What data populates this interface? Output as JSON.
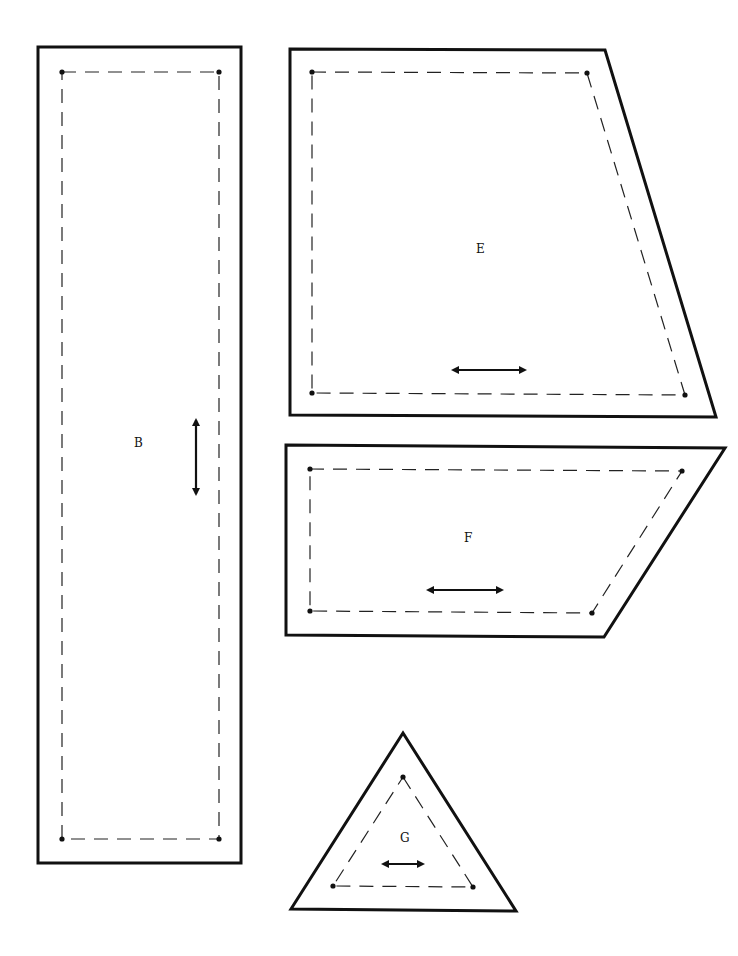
{
  "pattern": {
    "colors": {
      "line": "#111111",
      "background": "#ffffff"
    },
    "pieces": [
      {
        "id": "B",
        "label": "B",
        "shape": "rectangle",
        "grainline": "vertical"
      },
      {
        "id": "E",
        "label": "E",
        "shape": "trapezoid",
        "grainline": "horizontal"
      },
      {
        "id": "F",
        "label": "F",
        "shape": "parallelogram",
        "grainline": "horizontal"
      },
      {
        "id": "G",
        "label": "G",
        "shape": "triangle",
        "grainline": "horizontal"
      }
    ],
    "legend": {
      "solid_line": "cutting-line",
      "dashed_line": "seam-line",
      "dots": "seam-corner-dots",
      "double_arrow": "grainline"
    }
  }
}
